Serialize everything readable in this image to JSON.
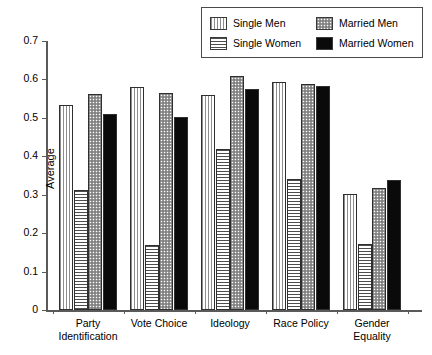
{
  "chart_data": {
    "type": "bar",
    "title": "",
    "xlabel": "",
    "ylabel": "Average",
    "ylim": [
      0,
      0.7
    ],
    "yticks": [
      "0",
      "0.1",
      "0.2",
      "0.3",
      "0.4",
      "0.5",
      "0.6",
      "0.7"
    ],
    "ytick_values": [
      0,
      0.1,
      0.2,
      0.3,
      0.4,
      0.5,
      0.6,
      0.7
    ],
    "grid": false,
    "legend_position": "top-right",
    "categories": [
      "Party\nIdentification",
      "Vote Choice",
      "Ideology",
      "Race Policy",
      "Gender\nEquality"
    ],
    "series": [
      {
        "name": "Single Men",
        "pattern": "vertical-lines",
        "color": "#8d8d8d",
        "values": [
          0.533,
          0.581,
          0.559,
          0.594,
          0.303
        ]
      },
      {
        "name": "Single Women",
        "pattern": "horizontal-lines",
        "color": "#4d4d4d",
        "values": [
          0.313,
          0.169,
          0.418,
          0.341,
          0.171
        ]
      },
      {
        "name": "Married Men",
        "pattern": "dotted",
        "color": "#9a9a9a",
        "values": [
          0.561,
          0.564,
          0.61,
          0.587,
          0.318
        ]
      },
      {
        "name": "Married Women",
        "pattern": "solid-black",
        "color": "#0a0a0a",
        "values": [
          0.51,
          0.502,
          0.575,
          0.584,
          0.339
        ]
      }
    ]
  },
  "legend": {
    "entries": [
      {
        "label": "Single Men"
      },
      {
        "label": "Married Men"
      },
      {
        "label": "Single Women"
      },
      {
        "label": "Married Women"
      }
    ]
  }
}
